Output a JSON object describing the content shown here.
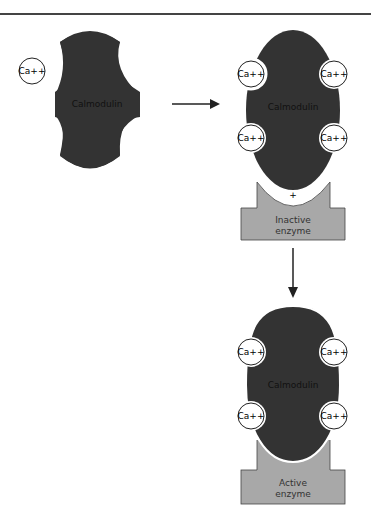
{
  "diagram": {
    "colors": {
      "protein": "#333333",
      "enzyme": "#a8a8a8",
      "line": "#222222",
      "background": "#ffffff"
    },
    "free_ion": {
      "label": "Ca++"
    },
    "stage1": {
      "protein_label": "Calmodulin"
    },
    "stage2": {
      "protein_label": "Calmodulin",
      "ions": [
        "Ca++",
        "Ca++",
        "Ca++",
        "Ca++"
      ],
      "plus": "+",
      "enzyme_line1": "Inactive",
      "enzyme_line2": "enzyme"
    },
    "stage3": {
      "protein_label": "Calmodulin",
      "ions": [
        "Ca++",
        "Ca++",
        "Ca++",
        "Ca++"
      ],
      "enzyme_line1": "Active",
      "enzyme_line2": "enzyme"
    }
  }
}
